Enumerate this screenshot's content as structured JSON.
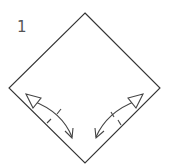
{
  "step": {
    "number": "1"
  },
  "diagram": {
    "type": "origami-step",
    "paper_shape": "square-rotated-45 (diamond)",
    "line_color": "#333333",
    "arrows": [
      {
        "name": "left-fold-and-unfold-arrow",
        "description": "fold-and-unfold arrow along lower-left edge",
        "marks": "two crease tick marks"
      },
      {
        "name": "right-fold-and-unfold-arrow",
        "description": "fold-and-unfold arrow along lower-right edge",
        "marks": "two crease tick marks"
      }
    ]
  }
}
